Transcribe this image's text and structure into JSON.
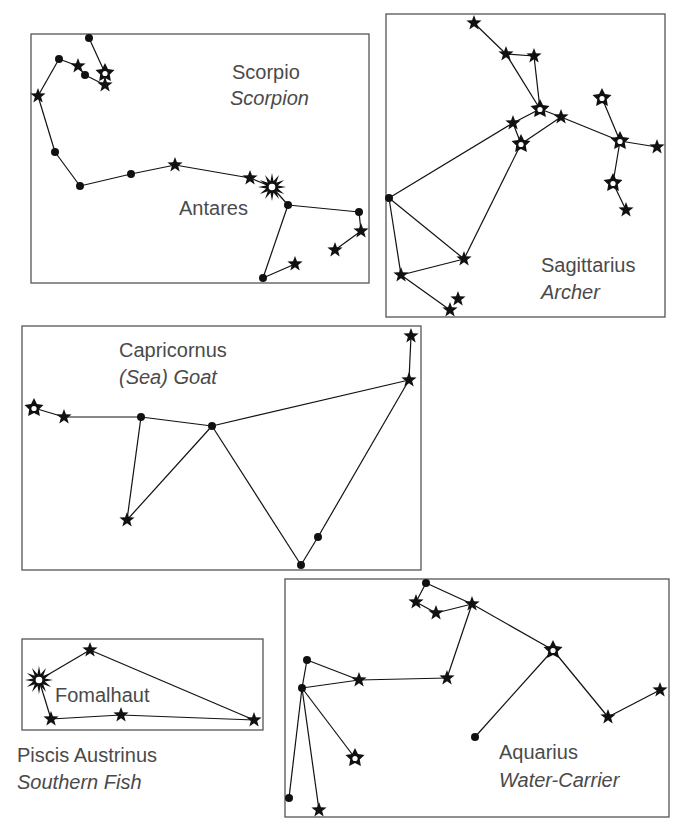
{
  "figure": {
    "colors": {
      "text": "#4a4a4a",
      "line": "#111111",
      "box": "#555555",
      "background": "#ffffff"
    },
    "constellations": [
      {
        "id": "scorpio",
        "name": "Scorpio",
        "common_name": "Scorpion",
        "box": [
          31,
          34,
          369,
          283
        ],
        "labels": [
          {
            "text": "Scorpio",
            "x": 232,
            "y": 80,
            "italic": false
          },
          {
            "text": "Scorpion",
            "x": 230,
            "y": 106,
            "italic": true
          },
          {
            "text": "Antares",
            "x": 179,
            "y": 216,
            "italic": false,
            "bright_star": true
          }
        ],
        "stars": [
          {
            "x": 89,
            "y": 38,
            "type": "dot"
          },
          {
            "x": 105,
            "y": 73,
            "type": "hollow"
          },
          {
            "x": 105,
            "y": 85,
            "type": "star"
          },
          {
            "x": 85,
            "y": 75,
            "type": "dot"
          },
          {
            "x": 78,
            "y": 66,
            "type": "star"
          },
          {
            "x": 59,
            "y": 59,
            "type": "dot"
          },
          {
            "x": 38,
            "y": 96,
            "type": "star"
          },
          {
            "x": 55,
            "y": 152,
            "type": "dot"
          },
          {
            "x": 80,
            "y": 186,
            "type": "dot"
          },
          {
            "x": 131,
            "y": 174,
            "type": "dot"
          },
          {
            "x": 175,
            "y": 165,
            "type": "star"
          },
          {
            "x": 250,
            "y": 178,
            "type": "star"
          },
          {
            "x": 272,
            "y": 187,
            "type": "bright"
          },
          {
            "x": 288,
            "y": 205,
            "type": "dot"
          },
          {
            "x": 359,
            "y": 212,
            "type": "dot"
          },
          {
            "x": 361,
            "y": 231,
            "type": "star"
          },
          {
            "x": 335,
            "y": 250,
            "type": "star"
          },
          {
            "x": 263,
            "y": 278,
            "type": "dot"
          },
          {
            "x": 295,
            "y": 264,
            "type": "star"
          }
        ],
        "edges": [
          [
            0,
            1
          ],
          [
            1,
            2
          ],
          [
            2,
            3
          ],
          [
            3,
            4
          ],
          [
            4,
            5
          ],
          [
            5,
            6
          ],
          [
            6,
            7
          ],
          [
            7,
            8
          ],
          [
            8,
            9
          ],
          [
            9,
            10
          ],
          [
            10,
            11
          ],
          [
            11,
            12
          ],
          [
            12,
            13
          ],
          [
            13,
            14
          ],
          [
            14,
            15
          ],
          [
            15,
            16
          ],
          [
            13,
            17
          ],
          [
            17,
            18
          ]
        ]
      },
      {
        "id": "sagittarius",
        "name": "Sagittarius",
        "common_name": "Archer",
        "box": [
          386,
          14,
          665,
          317
        ],
        "labels": [
          {
            "text": "Sagittarius",
            "x": 541,
            "y": 273,
            "italic": false
          },
          {
            "text": "Archer",
            "x": 541,
            "y": 300,
            "italic": true
          }
        ],
        "stars": [
          {
            "x": 474,
            "y": 23,
            "type": "star"
          },
          {
            "x": 506,
            "y": 54,
            "type": "star"
          },
          {
            "x": 534,
            "y": 56,
            "type": "star"
          },
          {
            "x": 540,
            "y": 109,
            "type": "hollow"
          },
          {
            "x": 513,
            "y": 123,
            "type": "star"
          },
          {
            "x": 521,
            "y": 144,
            "type": "hollow"
          },
          {
            "x": 561,
            "y": 117,
            "type": "star"
          },
          {
            "x": 602,
            "y": 98,
            "type": "hollow"
          },
          {
            "x": 620,
            "y": 141,
            "type": "hollow"
          },
          {
            "x": 657,
            "y": 147,
            "type": "star"
          },
          {
            "x": 613,
            "y": 183,
            "type": "hollow"
          },
          {
            "x": 626,
            "y": 210,
            "type": "star"
          },
          {
            "x": 389,
            "y": 198,
            "type": "dot"
          },
          {
            "x": 464,
            "y": 259,
            "type": "star"
          },
          {
            "x": 401,
            "y": 275,
            "type": "star"
          },
          {
            "x": 450,
            "y": 310,
            "type": "star"
          },
          {
            "x": 458,
            "y": 299,
            "type": "star"
          }
        ],
        "edges": [
          [
            0,
            1
          ],
          [
            1,
            2
          ],
          [
            1,
            3
          ],
          [
            2,
            3
          ],
          [
            3,
            4
          ],
          [
            4,
            5
          ],
          [
            3,
            6
          ],
          [
            5,
            6
          ],
          [
            6,
            8
          ],
          [
            7,
            8
          ],
          [
            8,
            9
          ],
          [
            8,
            10
          ],
          [
            10,
            11
          ],
          [
            4,
            12
          ],
          [
            5,
            13
          ],
          [
            12,
            13
          ],
          [
            12,
            14
          ],
          [
            13,
            14
          ],
          [
            14,
            15
          ]
        ]
      },
      {
        "id": "capricornus",
        "name": "Capricornus",
        "common_name": "(Sea) Goat",
        "box": [
          22,
          326,
          421,
          570
        ],
        "labels": [
          {
            "text": "Capricornus",
            "x": 119,
            "y": 358,
            "italic": false
          },
          {
            "text": "(Sea) Goat",
            "x": 119,
            "y": 385,
            "italic": true
          }
        ],
        "stars": [
          {
            "x": 34,
            "y": 408,
            "type": "hollow"
          },
          {
            "x": 64,
            "y": 417,
            "type": "star"
          },
          {
            "x": 141,
            "y": 417,
            "type": "dot"
          },
          {
            "x": 212,
            "y": 426,
            "type": "dot"
          },
          {
            "x": 127,
            "y": 520,
            "type": "star"
          },
          {
            "x": 301,
            "y": 565,
            "type": "dot"
          },
          {
            "x": 318,
            "y": 537,
            "type": "dot"
          },
          {
            "x": 409,
            "y": 380,
            "type": "star"
          },
          {
            "x": 411,
            "y": 336,
            "type": "star"
          }
        ],
        "edges": [
          [
            0,
            1
          ],
          [
            1,
            2
          ],
          [
            2,
            3
          ],
          [
            2,
            4
          ],
          [
            3,
            4
          ],
          [
            3,
            5
          ],
          [
            5,
            6
          ],
          [
            6,
            7
          ],
          [
            3,
            7
          ],
          [
            7,
            8
          ]
        ]
      },
      {
        "id": "piscis-austrinus",
        "name": "Piscis Austrinus",
        "common_name": "Southern Fish",
        "box": [
          22,
          639,
          263,
          730
        ],
        "labels": [
          {
            "text": "Fomalhaut",
            "x": 55,
            "y": 703,
            "italic": false,
            "bright_star": true
          },
          {
            "text": "Piscis Austrinus",
            "x": 17,
            "y": 763,
            "italic": false,
            "outside_box": true
          },
          {
            "text": "Southern Fish",
            "x": 17,
            "y": 790,
            "italic": true,
            "outside_box": true
          }
        ],
        "stars": [
          {
            "x": 39,
            "y": 680,
            "type": "bright"
          },
          {
            "x": 90,
            "y": 650,
            "type": "star"
          },
          {
            "x": 51,
            "y": 719,
            "type": "star"
          },
          {
            "x": 121,
            "y": 715,
            "type": "star"
          },
          {
            "x": 254,
            "y": 720,
            "type": "star"
          }
        ],
        "edges": [
          [
            0,
            1
          ],
          [
            1,
            4
          ],
          [
            0,
            2
          ],
          [
            2,
            3
          ],
          [
            3,
            4
          ]
        ]
      },
      {
        "id": "aquarius",
        "name": "Aquarius",
        "common_name": "Water-Carrier",
        "box": [
          285,
          579,
          669,
          817
        ],
        "labels": [
          {
            "text": "Aquarius",
            "x": 499,
            "y": 760,
            "italic": false
          },
          {
            "text": "Water-Carrier",
            "x": 499,
            "y": 788,
            "italic": true
          }
        ],
        "stars": [
          {
            "x": 426,
            "y": 583,
            "type": "dot"
          },
          {
            "x": 416,
            "y": 602,
            "type": "star"
          },
          {
            "x": 436,
            "y": 613,
            "type": "star"
          },
          {
            "x": 472,
            "y": 604,
            "type": "star"
          },
          {
            "x": 553,
            "y": 650,
            "type": "hollow"
          },
          {
            "x": 608,
            "y": 717,
            "type": "star"
          },
          {
            "x": 660,
            "y": 690,
            "type": "star"
          },
          {
            "x": 475,
            "y": 737,
            "type": "dot"
          },
          {
            "x": 447,
            "y": 678,
            "type": "star"
          },
          {
            "x": 359,
            "y": 680,
            "type": "star"
          },
          {
            "x": 307,
            "y": 660,
            "type": "dot"
          },
          {
            "x": 302,
            "y": 688,
            "type": "dot"
          },
          {
            "x": 355,
            "y": 758,
            "type": "hollow"
          },
          {
            "x": 289,
            "y": 798,
            "type": "dot"
          },
          {
            "x": 319,
            "y": 810,
            "type": "star"
          }
        ],
        "edges": [
          [
            0,
            1
          ],
          [
            1,
            2
          ],
          [
            2,
            3
          ],
          [
            0,
            3
          ],
          [
            3,
            4
          ],
          [
            4,
            5
          ],
          [
            5,
            6
          ],
          [
            4,
            7
          ],
          [
            3,
            8
          ],
          [
            8,
            9
          ],
          [
            9,
            10
          ],
          [
            10,
            11
          ],
          [
            11,
            9
          ],
          [
            11,
            12
          ],
          [
            11,
            13
          ],
          [
            11,
            14
          ]
        ]
      }
    ]
  }
}
